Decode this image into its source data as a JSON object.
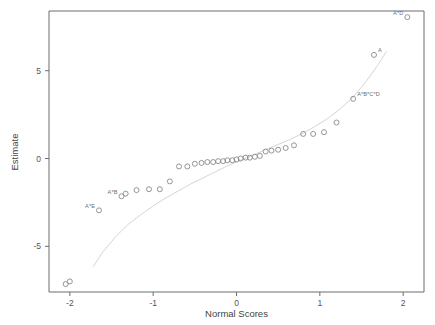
{
  "chart_data": {
    "type": "scatter",
    "title": "",
    "subtitle": "",
    "xlabel": "Normal Scores",
    "ylabel": "Estimate",
    "xlim": [
      -2.25,
      2.25
    ],
    "ylim": [
      -7.6,
      8.4
    ],
    "grid": false,
    "legend": null,
    "xticks": [
      -2,
      -1,
      0,
      1,
      2
    ],
    "xtick_labels": [
      "-2",
      "-1",
      "0",
      "1",
      "2"
    ],
    "yticks": [
      5,
      0,
      -5
    ],
    "ytick_labels": [
      "5",
      "0",
      "-5"
    ],
    "series": [
      {
        "name": "effect estimates",
        "marker": "open-circle",
        "x": [
          -2.05,
          -2.0,
          -1.65,
          -1.38,
          -1.33,
          -1.2,
          -1.05,
          -0.92,
          -0.8,
          -0.69,
          -0.59,
          -0.5,
          -0.42,
          -0.35,
          -0.28,
          -0.22,
          -0.16,
          -0.11,
          -0.05,
          0.0,
          0.05,
          0.11,
          0.16,
          0.22,
          0.28,
          0.35,
          0.42,
          0.5,
          0.59,
          0.69,
          0.8,
          0.92,
          1.05,
          1.2,
          1.4,
          1.65,
          2.05
        ],
        "y": [
          -7.15,
          -7.0,
          -2.95,
          -2.15,
          -2.0,
          -1.8,
          -1.75,
          -1.75,
          -1.3,
          -0.45,
          -0.45,
          -0.3,
          -0.25,
          -0.2,
          -0.2,
          -0.15,
          -0.15,
          -0.1,
          -0.1,
          -0.05,
          0.0,
          0.05,
          0.05,
          0.1,
          0.15,
          0.4,
          0.45,
          0.5,
          0.6,
          0.75,
          1.4,
          1.4,
          1.5,
          2.05,
          3.4,
          5.9,
          8.05
        ]
      }
    ],
    "annotations": [
      {
        "label": "A*E",
        "x": -1.65,
        "y": -2.95,
        "anchor": "right"
      },
      {
        "label": "A*B",
        "x": -1.38,
        "y": -2.15,
        "anchor": "right"
      },
      {
        "label": "A*B*C*D",
        "x": 1.4,
        "y": 3.4,
        "anchor": "left"
      },
      {
        "label": "A",
        "x": 1.65,
        "y": 5.9,
        "anchor": "left"
      },
      {
        "label": "A*D",
        "x": 2.05,
        "y": 8.05,
        "anchor": "right"
      }
    ],
    "reference_curve": {
      "name": "fitted half-normal reference line",
      "x": [
        -1.72,
        -1.6,
        -1.45,
        -1.3,
        -1.15,
        -1.0,
        -0.85,
        -0.7,
        -0.55,
        -0.4,
        -0.25,
        -0.1,
        0.05,
        0.2,
        0.35,
        0.5,
        0.65,
        0.8,
        0.95,
        1.1,
        1.25,
        1.4,
        1.55,
        1.7,
        1.8
      ],
      "y": [
        -6.15,
        -5.3,
        -4.45,
        -3.75,
        -3.2,
        -2.7,
        -2.25,
        -1.85,
        -1.45,
        -1.1,
        -0.75,
        -0.4,
        -0.1,
        0.2,
        0.5,
        0.8,
        1.1,
        1.45,
        1.85,
        2.3,
        2.85,
        3.5,
        4.35,
        5.35,
        6.1
      ]
    }
  },
  "colors": {
    "frame": "#6d6d6d",
    "point_stroke": "#8a8a8a",
    "reference_curve": "#cfcfcf",
    "tick_label": "#555555",
    "axis_title": "#444444",
    "point_label": "#6f6f6f",
    "background": "#ffffff"
  }
}
